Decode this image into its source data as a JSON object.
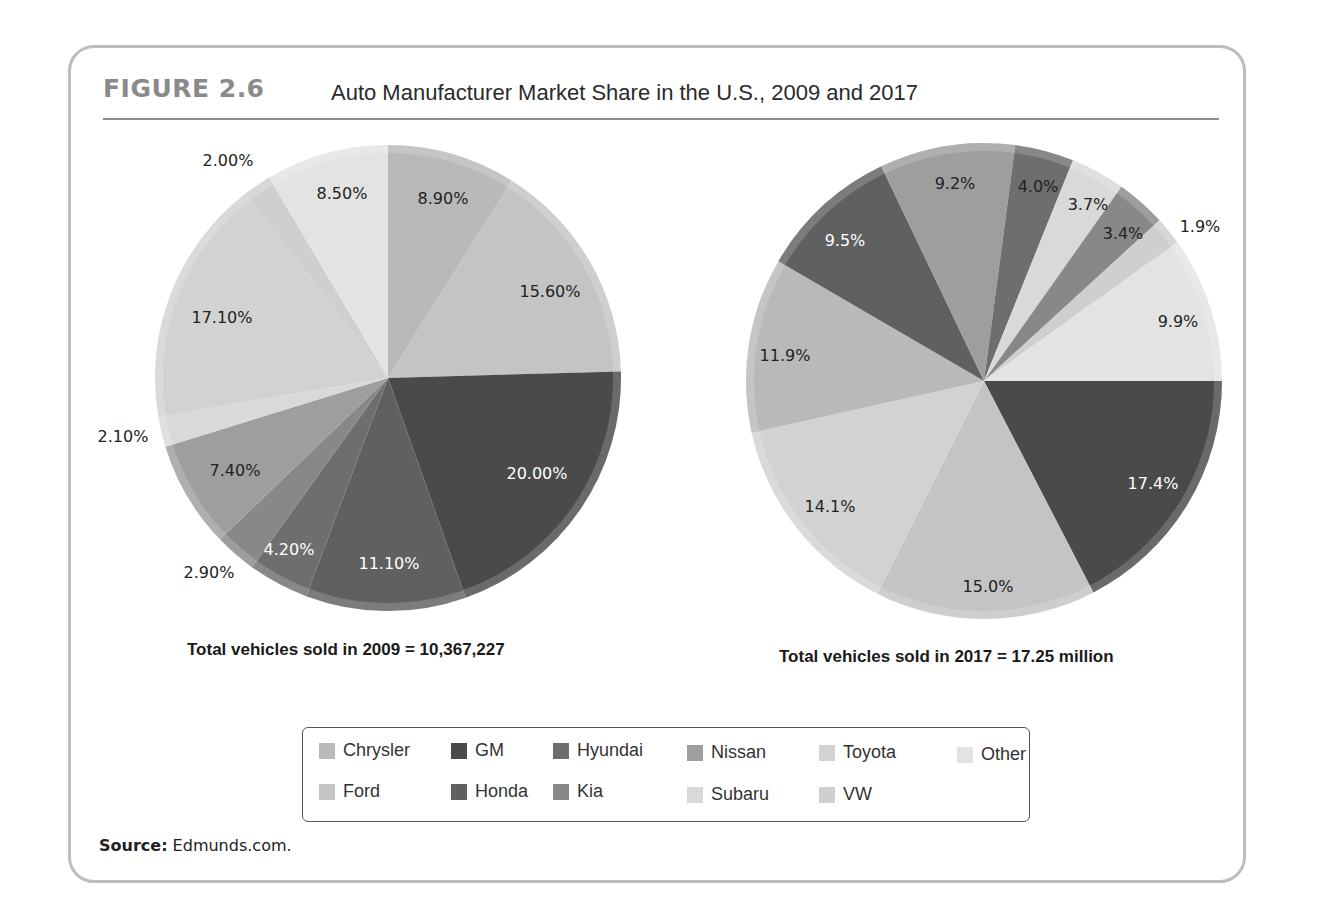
{
  "figure": {
    "label": "FIGURE 2.6",
    "title": "Auto Manufacturer Market Share in the U.S., 2009 and 2017",
    "source_label": "Source:",
    "source_text": " Edmunds.com."
  },
  "colors": {
    "Chrysler": "#b9b9b9",
    "Ford": "#c4c4c4",
    "GM": "#4a4a4a",
    "Honda": "#606060",
    "Hyundai": "#6e6e6e",
    "Kia": "#888888",
    "Nissan": "#9e9e9e",
    "Subaru": "#d9d9d9",
    "Toyota": "#d2d2d2",
    "VW": "#cfcfcf",
    "Other": "#e3e3e3"
  },
  "legend": {
    "items": [
      {
        "label": "Chrysler",
        "key": "Chrysler"
      },
      {
        "label": "Ford",
        "key": "Ford"
      },
      {
        "label": "GM",
        "key": "GM"
      },
      {
        "label": "Honda",
        "key": "Honda"
      },
      {
        "label": "Hyundai",
        "key": "Hyundai"
      },
      {
        "label": "Kia",
        "key": "Kia"
      },
      {
        "label": "Nissan",
        "key": "Nissan"
      },
      {
        "label": "Subaru",
        "key": "Subaru"
      },
      {
        "label": "Toyota",
        "key": "Toyota"
      },
      {
        "label": "VW",
        "key": "VW"
      },
      {
        "label": "Other",
        "key": "Other"
      }
    ]
  },
  "chart_data": [
    {
      "type": "pie",
      "title": "2009",
      "caption": "Total vehicles sold in 2009 = 10,367,227",
      "start_angle_deg": 0,
      "direction": "clockwise",
      "categories": [
        "Chrysler",
        "Ford",
        "GM",
        "Honda",
        "Hyundai",
        "Kia",
        "Nissan",
        "Subaru",
        "Toyota",
        "VW",
        "Other"
      ],
      "values": [
        8.9,
        15.6,
        20.0,
        11.1,
        4.2,
        2.9,
        7.4,
        2.1,
        17.1,
        2.0,
        8.5
      ],
      "labels": [
        "8.90%",
        "15.60%",
        "20.00%",
        "11.10%",
        "4.20%",
        "2.90%",
        "7.40%",
        "2.10%",
        "17.10%",
        "2.00%",
        "8.50%"
      ],
      "label_positions": [
        [
          443,
          198
        ],
        [
          550,
          291
        ],
        [
          537,
          473
        ],
        [
          389,
          563
        ],
        [
          289,
          549
        ],
        [
          209,
          572
        ],
        [
          235,
          470
        ],
        [
          123,
          436
        ],
        [
          222,
          317
        ],
        [
          228,
          160
        ],
        [
          342,
          193
        ]
      ],
      "label_colors": [
        "#222",
        "#222",
        "#fff",
        "#fff",
        "#fff",
        "#222",
        "#222",
        "#222",
        "#222",
        "#222",
        "#222"
      ],
      "unit": "%"
    },
    {
      "type": "pie",
      "title": "2017",
      "caption": "Total vehicles sold in 2017 = 17.25 million",
      "start_angle_deg": 90,
      "direction": "clockwise",
      "categories": [
        "GM",
        "Ford",
        "Toyota",
        "Chrysler",
        "Honda",
        "Nissan",
        "Hyundai",
        "Subaru",
        "Kia",
        "VW",
        "Other"
      ],
      "values": [
        17.4,
        15.0,
        14.1,
        11.9,
        9.5,
        9.2,
        4.0,
        3.7,
        3.4,
        1.9,
        9.9
      ],
      "labels": [
        "17.4%",
        "15.0%",
        "14.1%",
        "11.9%",
        "9.5%",
        "9.2%",
        "4.0%",
        "3.7%",
        "3.4%",
        "1.9%",
        "9.9%"
      ],
      "label_positions": [
        [
          1153,
          483
        ],
        [
          988,
          586
        ],
        [
          830,
          506
        ],
        [
          785,
          355
        ],
        [
          845,
          240
        ],
        [
          955,
          183
        ],
        [
          1038,
          186
        ],
        [
          1088,
          204
        ],
        [
          1123,
          233
        ],
        [
          1200,
          226
        ],
        [
          1178,
          321
        ]
      ],
      "label_colors": [
        "#fff",
        "#222",
        "#222",
        "#222",
        "#fff",
        "#222",
        "#222",
        "#222",
        "#222",
        "#222",
        "#222"
      ],
      "unit": "%"
    }
  ]
}
